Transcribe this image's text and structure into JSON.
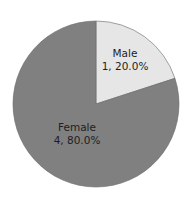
{
  "chart_data": {
    "type": "pie",
    "title": "",
    "categories": [
      "Male",
      "Female"
    ],
    "values": [
      1,
      4
    ],
    "percentages": [
      20.0,
      80.0
    ],
    "labels": [
      {
        "name": "Male",
        "detail": "1, 20.0%"
      },
      {
        "name": "Female",
        "detail": "4, 80.0%"
      }
    ],
    "colors": [
      "#e6e6e6",
      "#808080"
    ],
    "start_angle_deg": 0,
    "direction": "clockwise",
    "legend": "none"
  }
}
